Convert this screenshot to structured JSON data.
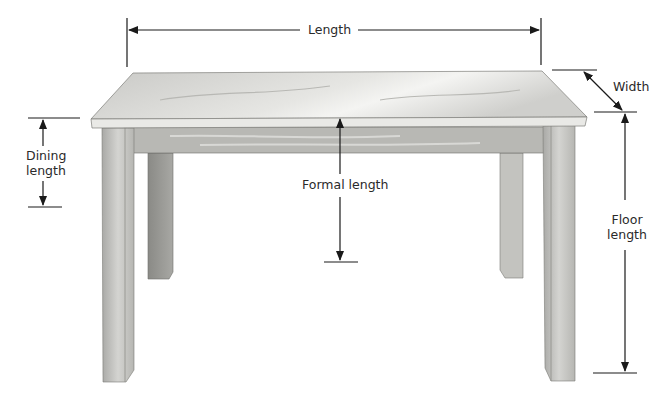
{
  "diagram": {
    "labels": {
      "length": "Length",
      "width": "Width",
      "dining_line1": "Dining",
      "dining_line2": "length",
      "formal": "Formal length",
      "floor_line1": "Floor",
      "floor_line2": "length"
    },
    "colors": {
      "line": "#1a1a1a",
      "wood_light": "#d9d9d6",
      "wood_mid": "#bdbdb9",
      "wood_dark": "#8f8f8b",
      "background": "#ffffff"
    }
  }
}
